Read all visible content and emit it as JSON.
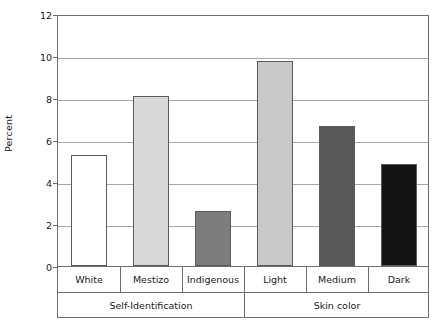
{
  "chart_data": {
    "type": "bar",
    "title": "",
    "subtitle": "",
    "xlabel": "",
    "ylabel": "Percent",
    "ylim": [
      0,
      12
    ],
    "ytick_labels": [
      "0",
      "2",
      "4",
      "6",
      "8",
      "10",
      "12"
    ],
    "ytick_values": [
      0,
      2,
      4,
      6,
      8,
      10,
      12
    ],
    "grid": true,
    "legend": "none",
    "categories": [
      "White",
      "Mestizo",
      "Indigenous",
      "Light",
      "Medium",
      "Dark"
    ],
    "values": [
      5.3,
      8.1,
      2.6,
      9.75,
      6.65,
      4.85
    ],
    "bar_colors": [
      "#ffffff",
      "#d8d8d8",
      "#7d7d7d",
      "#c9c9c9",
      "#585858",
      "#141414"
    ],
    "bar_edge_color": "#5a5a5a",
    "groups": [
      {
        "label": "Self-Identification",
        "categories": [
          "White",
          "Mestizo",
          "Indigenous"
        ]
      },
      {
        "label": "Skin color",
        "categories": [
          "Light",
          "Medium",
          "Dark"
        ]
      }
    ],
    "bars": [
      {
        "category": "White",
        "value": 5.3,
        "color": "#ffffff",
        "group": "Self-Identification"
      },
      {
        "category": "Mestizo",
        "value": 8.1,
        "color": "#d8d8d8",
        "group": "Self-Identification"
      },
      {
        "category": "Indigenous",
        "value": 2.6,
        "color": "#7d7d7d",
        "group": "Self-Identification"
      },
      {
        "category": "Light",
        "value": 9.75,
        "color": "#c9c9c9",
        "group": "Skin color"
      },
      {
        "category": "Medium",
        "value": 6.65,
        "color": "#585858",
        "group": "Skin color"
      },
      {
        "category": "Dark",
        "value": 4.85,
        "color": "#141414",
        "group": "Skin color"
      }
    ]
  }
}
